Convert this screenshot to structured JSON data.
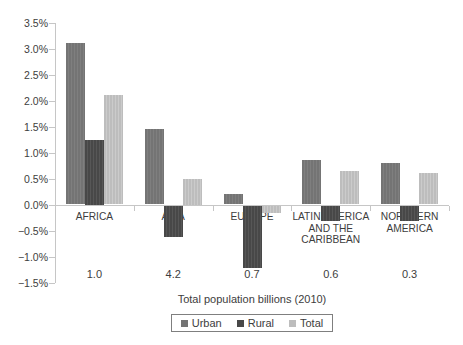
{
  "figure": {
    "background": "#ffffff",
    "axis_color": "#c6c6c6",
    "text_color": "#3d3d3d"
  },
  "chart_data": {
    "type": "bar",
    "title": "",
    "categories": [
      "AFRICA",
      "ASIA",
      "EUROPE",
      "LATIN AMERICA AND THE CARIBBEAN",
      "NORTHERN AMERICA"
    ],
    "series": [
      {
        "name": "Urban",
        "color": "#747474",
        "stripe": "#7f7f7f",
        "values": [
          3.1,
          1.45,
          0.2,
          0.85,
          0.8
        ]
      },
      {
        "name": "Rural",
        "color": "#484848",
        "stripe": "#575757",
        "values": [
          1.25,
          -0.6,
          -1.2,
          -0.3,
          -0.3
        ]
      },
      {
        "name": "Total",
        "color": "#bdbdbd",
        "stripe": "#cbcbcb",
        "values": [
          2.1,
          0.5,
          -0.15,
          0.65,
          0.6
        ]
      }
    ],
    "population_labels": [
      "1.0",
      "4.2",
      "0.7",
      "0.6",
      "0.3"
    ],
    "xlabel": "Total population billions (2010)",
    "ylabel": "",
    "ylim": [
      -1.5,
      3.5
    ],
    "ytick_values": [
      3.5,
      3.0,
      2.5,
      2.0,
      1.5,
      1.0,
      0.5,
      0.0,
      -0.5,
      -1.0,
      -1.5
    ],
    "ytick_labels": [
      "3.5%",
      "3.0%",
      "2.5%",
      "2.0%",
      "1.5%",
      "1.0%",
      "0.5%",
      "0.0%",
      "−0.5%",
      "−1.0%",
      "−1.5%"
    ],
    "grid": false,
    "legend_position": "bottom"
  }
}
